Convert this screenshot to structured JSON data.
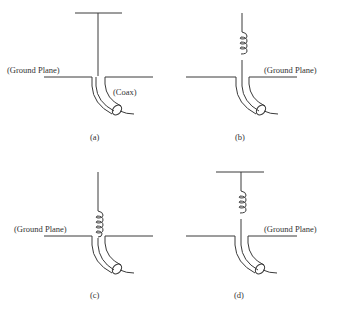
{
  "diagram": {
    "panels": [
      {
        "id": "a",
        "caption": "(a)",
        "ground_label": "(Ground Plane)",
        "coax_label": "(Coax)",
        "top_hat": true,
        "loading_coil": false
      },
      {
        "id": "b",
        "caption": "(b)",
        "ground_label": "(Ground Plane)",
        "top_hat": false,
        "loading_coil": true,
        "coil_position": "mid"
      },
      {
        "id": "c",
        "caption": "(c)",
        "ground_label": "(Ground Plane)",
        "top_hat": false,
        "loading_coil": true,
        "coil_position": "base"
      },
      {
        "id": "d",
        "caption": "(d)",
        "ground_label": "(Ground Plane)",
        "top_hat": true,
        "loading_coil": true,
        "coil_position": "mid"
      }
    ],
    "colors": {
      "line": "#3a3a3a",
      "text": "#333333",
      "background": "#ffffff"
    }
  }
}
